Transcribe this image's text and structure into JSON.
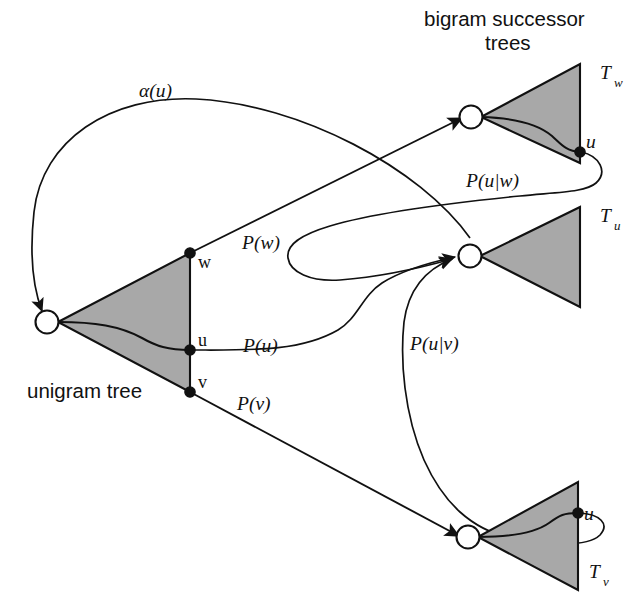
{
  "figure": {
    "background_color": "#ffffff",
    "ink_color": "#111111",
    "tree_fill_color": "#a8a8a8"
  },
  "captions": {
    "bigram_line1": "bigram successor",
    "bigram_line2": "trees",
    "unigram": "unigram tree"
  },
  "trees": {
    "unigram": {
      "label": "unigram tree",
      "nodes": [
        {
          "id": "w",
          "label": "w"
        },
        {
          "id": "u",
          "label": "u"
        },
        {
          "id": "v",
          "label": "v"
        }
      ]
    },
    "bigram": [
      {
        "id": "Tw",
        "label": "T",
        "subscript": "w",
        "leaf_label": "u"
      },
      {
        "id": "Tu",
        "label": "T",
        "subscript": "u",
        "leaf_label": ""
      },
      {
        "id": "Tv",
        "label": "T",
        "subscript": "v",
        "leaf_label": "u"
      }
    ]
  },
  "edges": [
    {
      "id": "alpha-u",
      "label": "α(u)",
      "from": "Tu-root",
      "to": "unigram-root"
    },
    {
      "id": "p-w",
      "label": "P(w)",
      "from": "unigram-w",
      "to": "Tw-root"
    },
    {
      "id": "p-u",
      "label": "P(u)",
      "from": "unigram-u",
      "to": "Tu-root"
    },
    {
      "id": "p-v",
      "label": "P(v)",
      "from": "unigram-v",
      "to": "Tv-root"
    },
    {
      "id": "p-u-given-w",
      "label": "P(u|w)",
      "from": "Tw-leaf-u",
      "to": "Tu-root"
    },
    {
      "id": "p-u-given-v",
      "label": "P(u|v)",
      "from": "Tv-leaf-u",
      "to": "Tu-root"
    }
  ],
  "labels": {
    "alpha_u": "α(u)",
    "p_w": "P(w)",
    "p_u": "P(u)",
    "p_v": "P(v)",
    "p_u_given_w": "P(u|w)",
    "p_u_given_v": "P(u|v)",
    "node_w": "w",
    "node_u": "u",
    "node_v": "v",
    "leaf_u_tw": "u",
    "leaf_u_tv": "u",
    "T": "T",
    "sub_w": "w",
    "sub_u": "u",
    "sub_v": "v"
  }
}
